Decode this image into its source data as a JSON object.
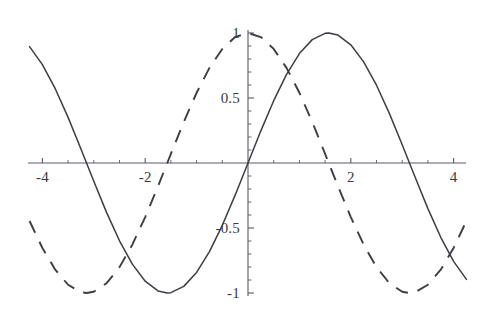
{
  "figure": {
    "title": "",
    "background_color": "#ffffff",
    "axis_color": "#5a5a66",
    "curve_color": "#3d3d45"
  },
  "axes": {
    "x_axis_label": "",
    "y_axis_label": "",
    "x_ticks_labeled": [
      "-4",
      "-2",
      "2",
      "4"
    ],
    "y_ticks_labeled": [
      "1",
      "0.5",
      "-0.5",
      "-1"
    ],
    "x_minor_tick_interval": "0.5",
    "y_minor_tick_interval": "0.1",
    "grid": "off",
    "legend": "none",
    "frame": "none",
    "origin_label": ""
  },
  "chart_data": {
    "type": "line",
    "title": "",
    "xlabel": "",
    "ylabel": "",
    "xlim": [
      -4.25,
      4.25
    ],
    "ylim": [
      -1.05,
      1.05
    ],
    "xticks": [
      -4,
      -2,
      2,
      4
    ],
    "xtick_labels": [
      "-4",
      "-2",
      "2",
      "4"
    ],
    "yticks": [
      1,
      0.5,
      -0.5,
      -1
    ],
    "ytick_labels": [
      "1",
      "0.5",
      "-0.5",
      "-1"
    ],
    "grid": false,
    "legend_position": "none",
    "series": [
      {
        "name": "sin(x)",
        "style": "solid",
        "color": "#3d3d45",
        "x": [
          -4.25,
          -4.0,
          -3.75,
          -3.5,
          -3.25,
          -3.0,
          -2.75,
          -2.5,
          -2.25,
          -2.0,
          -1.75,
          -1.5708,
          -1.5,
          -1.25,
          -1.0,
          -0.75,
          -0.5,
          -0.25,
          0.0,
          0.25,
          0.5,
          0.75,
          1.0,
          1.25,
          1.5,
          1.5708,
          1.75,
          2.0,
          2.25,
          2.5,
          2.75,
          3.0,
          3.25,
          3.5,
          3.75,
          4.0,
          4.25
        ],
        "y": [
          0.895,
          0.7568,
          0.5716,
          0.3508,
          0.1082,
          -0.1411,
          -0.3817,
          -0.5985,
          -0.7781,
          -0.9093,
          -0.9839,
          -1.0,
          -0.9975,
          -0.949,
          -0.8415,
          -0.6816,
          -0.4794,
          -0.2474,
          0.0,
          0.2474,
          0.4794,
          0.6816,
          0.8415,
          0.949,
          0.9975,
          1.0,
          0.9839,
          0.9093,
          0.7781,
          0.5985,
          0.3817,
          0.1411,
          -0.1082,
          -0.3508,
          -0.5716,
          -0.7568,
          -0.895
        ]
      },
      {
        "name": "cos(x)",
        "style": "dashed",
        "color": "#3d3d45",
        "x": [
          -4.25,
          -4.0,
          -3.75,
          -3.5,
          -3.25,
          -3.1416,
          -3.0,
          -2.75,
          -2.5,
          -2.25,
          -2.0,
          -1.75,
          -1.5708,
          -1.5,
          -1.25,
          -1.0,
          -0.75,
          -0.5,
          -0.25,
          0.0,
          0.25,
          0.5,
          0.75,
          1.0,
          1.25,
          1.5,
          1.5708,
          1.75,
          2.0,
          2.25,
          2.5,
          2.75,
          3.0,
          3.1416,
          3.25,
          3.5,
          3.75,
          4.0,
          4.25
        ],
        "y": [
          -0.4461,
          -0.6536,
          -0.8205,
          -0.9365,
          -0.9941,
          -1.0,
          -0.99,
          -0.9243,
          -0.8011,
          -0.6282,
          -0.4161,
          -0.1782,
          0.0,
          0.0707,
          0.3153,
          0.5403,
          0.7317,
          0.8776,
          0.9689,
          1.0,
          0.9689,
          0.8776,
          0.7317,
          0.5403,
          0.3153,
          0.0707,
          0.0,
          -0.1782,
          -0.4161,
          -0.6282,
          -0.8011,
          -0.9243,
          -0.99,
          -1.0,
          -0.9941,
          -0.9365,
          -0.8205,
          -0.6536,
          -0.4461
        ]
      }
    ]
  }
}
